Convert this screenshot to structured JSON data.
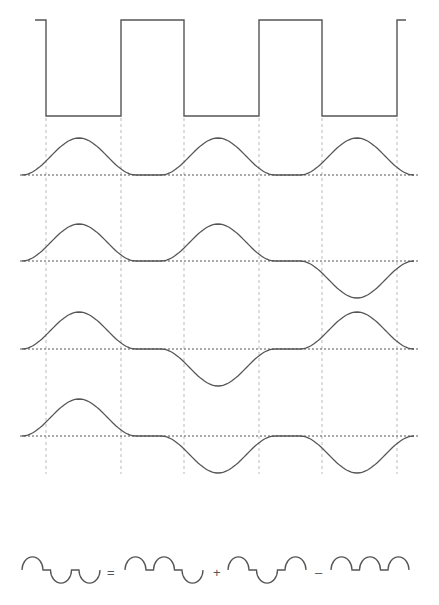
{
  "figure": {
    "square_wave": {
      "levels": [
        "high",
        "low",
        "high",
        "low",
        "high",
        "low",
        "high"
      ],
      "description": "periodic square wave with six half-period segments"
    },
    "waveforms": [
      {
        "id": "wave-1",
        "signs": [
          1,
          1,
          1
        ]
      },
      {
        "id": "wave-2",
        "signs": [
          1,
          1,
          -1
        ]
      },
      {
        "id": "wave-3",
        "signs": [
          1,
          -1,
          1
        ]
      },
      {
        "id": "wave-4",
        "signs": [
          1,
          -1,
          -1
        ]
      }
    ],
    "equation": {
      "lhs": [
        1,
        -1,
        -1
      ],
      "terms": [
        {
          "operator": "=",
          "signs": [
            1,
            1,
            -1
          ]
        },
        {
          "operator": "+",
          "signs": [
            1,
            -1,
            1
          ]
        },
        {
          "operator": "–",
          "signs": [
            1,
            1,
            1
          ]
        }
      ]
    }
  }
}
